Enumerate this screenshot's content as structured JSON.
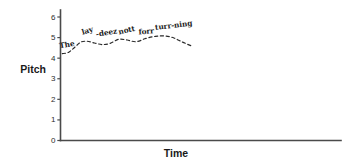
{
  "chart_data": {
    "type": "line",
    "title": "",
    "xlabel": "Time",
    "ylabel": "Pitch",
    "grid": false,
    "legend": "none",
    "style": "hand-drawn dashed pitch contour",
    "xlim": [
      0,
      10
    ],
    "ylim": [
      0,
      6.35
    ],
    "y_ticks": [
      "0",
      "1",
      "2",
      "3",
      "4",
      "5",
      "6"
    ],
    "y_tick_values": [
      0,
      1,
      2,
      3,
      4,
      5,
      6
    ],
    "x_ticks": [],
    "utterance": "The lay -deez nott forr turr-ning",
    "series": [
      {
        "name": "pitch contour",
        "x": [
          0.08,
          0.35,
          0.62,
          0.9,
          1.18,
          1.5,
          1.85,
          2.2,
          2.58,
          2.95,
          3.35,
          3.78,
          4.2,
          4.62,
          5.02,
          5.4,
          5.78
        ],
        "values": [
          4.22,
          4.28,
          4.52,
          4.78,
          4.82,
          4.74,
          4.66,
          4.72,
          4.92,
          4.88,
          4.8,
          4.96,
          5.06,
          5.08,
          4.98,
          4.78,
          4.6
        ]
      }
    ],
    "annotations": [
      {
        "label": "The",
        "x": 0.3,
        "y": 4.54,
        "rotation": -9
      },
      {
        "label": "lay",
        "x": 1.22,
        "y": 5.22,
        "rotation": -16
      },
      {
        "label": "-deez",
        "x": 2.05,
        "y": 5.12,
        "rotation": -9
      },
      {
        "label": "nott",
        "x": 2.95,
        "y": 5.24,
        "rotation": -13
      },
      {
        "label": "forr",
        "x": 3.8,
        "y": 5.18,
        "rotation": -4
      },
      {
        "label": "turr-ning",
        "x": 5.02,
        "y": 5.48,
        "rotation": -7
      }
    ]
  },
  "axes": {
    "pitch_label": "Pitch",
    "time_label": "Time"
  },
  "colors": {
    "axis": "#4a4a4a",
    "contour": "#2a2a2a",
    "text": "#1a1a1a",
    "background": "#ffffff"
  }
}
